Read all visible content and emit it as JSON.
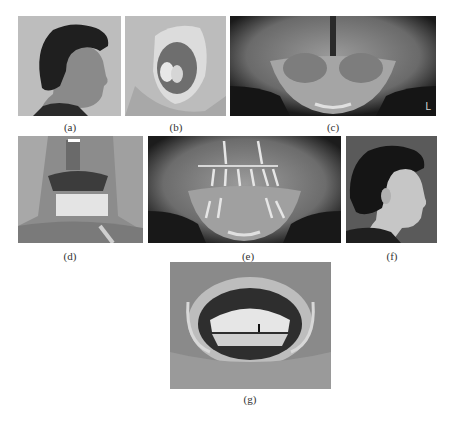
{
  "figure": {
    "panels": [
      {
        "id": "a",
        "caption": "(a)",
        "content": "Preoperative right profile photograph of patient"
      },
      {
        "id": "b",
        "caption": "(b)",
        "content": "Intraoral view of maxilla with retractor"
      },
      {
        "id": "c",
        "caption": "(c)",
        "content": "Preoperative panoramic radiograph",
        "marker": "L"
      },
      {
        "id": "d",
        "caption": "(d)",
        "content": "Intraoperative view with provisional teeth and retractors"
      },
      {
        "id": "e",
        "caption": "(e)",
        "content": "Postoperative panoramic radiograph with implants"
      },
      {
        "id": "f",
        "caption": "(f)",
        "content": "Postoperative right profile photograph"
      },
      {
        "id": "g",
        "caption": "(g)",
        "content": "Final intraoral view with retractors showing prosthesis"
      }
    ]
  }
}
